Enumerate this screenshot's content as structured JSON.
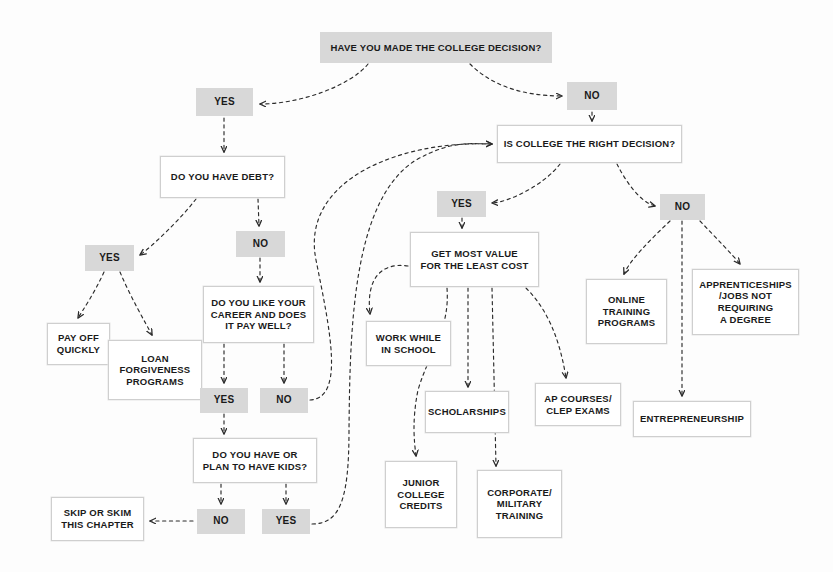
{
  "diagram": {
    "background_color": "#fdfdfd",
    "filled_node_color": "#d8d8d8",
    "outlined_node_border_color": "#cfcfcf",
    "text_color": "#1a1a1a"
  },
  "nodes": [
    {
      "id": "q_college_decision",
      "label": "HAVE YOU MADE THE COLLEGE DECISION?",
      "style": "filled",
      "x": 320,
      "y": 32,
      "w": 232,
      "h": 31,
      "font": 9.5
    },
    {
      "id": "yes_1",
      "label": "YES",
      "style": "filled",
      "x": 196,
      "y": 88,
      "w": 57,
      "h": 28,
      "font": 10
    },
    {
      "id": "no_1",
      "label": "NO",
      "style": "filled",
      "x": 567,
      "y": 82,
      "w": 50,
      "h": 28,
      "font": 10
    },
    {
      "id": "q_have_debt",
      "label": "DO YOU HAVE DEBT?",
      "style": "outlined",
      "x": 160,
      "y": 156,
      "w": 125,
      "h": 42,
      "font": 9.5
    },
    {
      "id": "q_college_right",
      "label": "IS COLLEGE THE RIGHT DECISION?",
      "style": "outlined",
      "x": 497,
      "y": 125,
      "w": 185,
      "h": 38,
      "font": 9.5
    },
    {
      "id": "yes_2",
      "label": "YES",
      "style": "filled",
      "x": 85,
      "y": 245,
      "w": 49,
      "h": 26,
      "font": 10
    },
    {
      "id": "no_2",
      "label": "NO",
      "style": "filled",
      "x": 236,
      "y": 231,
      "w": 49,
      "h": 26,
      "font": 10
    },
    {
      "id": "yes_3",
      "label": "YES",
      "style": "filled",
      "x": 437,
      "y": 191,
      "w": 49,
      "h": 26,
      "font": 10
    },
    {
      "id": "no_3",
      "label": "NO",
      "style": "filled",
      "x": 660,
      "y": 194,
      "w": 45,
      "h": 26,
      "font": 10
    },
    {
      "id": "pay_off_quickly",
      "label": "PAY OFF\nQUICKLY",
      "style": "outlined",
      "x": 47,
      "y": 323,
      "w": 63,
      "h": 42,
      "font": 9.5
    },
    {
      "id": "loan_forgiveness",
      "label": "LOAN\nFORGIVENESS\nPROGRAMS",
      "style": "outlined",
      "x": 108,
      "y": 340,
      "w": 94,
      "h": 60,
      "font": 9.5
    },
    {
      "id": "q_like_career",
      "label": "DO YOU LIKE YOUR\nCAREER AND DOES\nIT PAY WELL?",
      "style": "outlined",
      "x": 203,
      "y": 286,
      "w": 111,
      "h": 57,
      "font": 9.5
    },
    {
      "id": "get_most_value",
      "label": "GET MOST VALUE\nFOR THE LEAST COST",
      "style": "outlined",
      "x": 410,
      "y": 232,
      "w": 129,
      "h": 55,
      "font": 9.5
    },
    {
      "id": "online_training",
      "label": "ONLINE\nTRAINING\nPROGRAMS",
      "style": "outlined",
      "x": 586,
      "y": 279,
      "w": 81,
      "h": 65,
      "font": 9.5
    },
    {
      "id": "apprenticeships",
      "label": "APPRENTICESHIPS\n/JOBS NOT\nREQUIRING\nA DEGREE",
      "style": "outlined",
      "x": 692,
      "y": 269,
      "w": 107,
      "h": 66,
      "font": 9.5
    },
    {
      "id": "work_while_school",
      "label": "WORK WHILE\nIN SCHOOL",
      "style": "outlined",
      "x": 366,
      "y": 321,
      "w": 85,
      "h": 45,
      "font": 9.5
    },
    {
      "id": "yes_4",
      "label": "YES",
      "style": "filled",
      "x": 200,
      "y": 388,
      "w": 48,
      "h": 25,
      "font": 10
    },
    {
      "id": "no_4",
      "label": "NO",
      "style": "filled",
      "x": 260,
      "y": 388,
      "w": 48,
      "h": 25,
      "font": 10
    },
    {
      "id": "scholarships",
      "label": "SCHOLARSHIPS",
      "style": "outlined",
      "x": 425,
      "y": 391,
      "w": 84,
      "h": 42,
      "font": 9.5
    },
    {
      "id": "ap_courses",
      "label": "AP COURSES/\nCLEP EXAMS",
      "style": "outlined",
      "x": 535,
      "y": 383,
      "w": 86,
      "h": 43,
      "font": 9.5
    },
    {
      "id": "entrepreneurship",
      "label": "ENTREPRENEURSHIP",
      "style": "outlined",
      "x": 633,
      "y": 401,
      "w": 118,
      "h": 36,
      "font": 9.5
    },
    {
      "id": "q_have_kids",
      "label": "DO YOU HAVE OR\nPLAN TO HAVE KIDS?",
      "style": "outlined",
      "x": 193,
      "y": 438,
      "w": 124,
      "h": 45,
      "font": 9.5
    },
    {
      "id": "junior_college",
      "label": "JUNIOR\nCOLLEGE\nCREDITS",
      "style": "outlined",
      "x": 385,
      "y": 461,
      "w": 72,
      "h": 67,
      "font": 9.5
    },
    {
      "id": "corporate_military",
      "label": "CORPORATE/\nMILITARY\nTRAINING",
      "style": "outlined",
      "x": 477,
      "y": 470,
      "w": 85,
      "h": 68,
      "font": 9.5
    },
    {
      "id": "no_5",
      "label": "NO",
      "style": "filled",
      "x": 197,
      "y": 509,
      "w": 48,
      "h": 25,
      "font": 10
    },
    {
      "id": "yes_5",
      "label": "YES",
      "style": "filled",
      "x": 262,
      "y": 509,
      "w": 48,
      "h": 25,
      "font": 10
    },
    {
      "id": "skip_or_skim",
      "label": "SKIP OR SKIM\nTHIS CHAPTER",
      "style": "outlined",
      "x": 51,
      "y": 497,
      "w": 93,
      "h": 44,
      "font": 9.5
    }
  ],
  "edges": [
    {
      "from": "q_college_decision",
      "to": "yes_1",
      "d": "M 368 64 C 350 86, 300 104, 260 104"
    },
    {
      "from": "q_college_decision",
      "to": "no_1",
      "d": "M 470 64 C 490 84, 520 96, 562 96"
    },
    {
      "from": "yes_1",
      "to": "q_have_debt",
      "d": "M 224 118 L 224 152"
    },
    {
      "from": "no_1",
      "to": "q_college_right",
      "d": "M 592 112 L 592 121"
    },
    {
      "from": "q_have_debt",
      "to": "yes_2",
      "d": "M 196 199 C 180 220, 150 248, 140 255"
    },
    {
      "from": "q_have_debt",
      "to": "no_2",
      "d": "M 258 199 L 259 226"
    },
    {
      "from": "q_college_right",
      "to": "yes_3",
      "d": "M 560 164 C 545 184, 510 202, 492 203"
    },
    {
      "from": "q_college_right",
      "to": "no_3",
      "d": "M 617 164 C 626 182, 640 202, 655 206"
    },
    {
      "from": "yes_2",
      "to": "pay_off_quickly",
      "d": "M 104 272 C 95 292, 83 310, 78 318"
    },
    {
      "from": "yes_2",
      "to": "loan_forgiveness",
      "d": "M 120 272 C 130 296, 145 322, 152 335"
    },
    {
      "from": "no_2",
      "to": "q_like_career",
      "d": "M 260 258 L 260 282"
    },
    {
      "from": "q_like_career",
      "to": "yes_4",
      "d": "M 224 344 L 224 383"
    },
    {
      "from": "q_like_career",
      "to": "no_4",
      "d": "M 284 344 L 284 383"
    },
    {
      "from": "yes_4",
      "to": "q_have_kids",
      "d": "M 224 414 L 224 434"
    },
    {
      "from": "q_have_kids",
      "to": "no_5",
      "d": "M 221 484 L 221 504"
    },
    {
      "from": "q_have_kids",
      "to": "yes_5",
      "d": "M 286 484 L 286 504"
    },
    {
      "from": "no_5",
      "to": "skip_or_skim",
      "d": "M 193 521 L 150 521"
    },
    {
      "from": "no_4",
      "to": "q_college_right",
      "d": "M 310 400 C 345 398, 330 330, 316 260 C 300 180, 400 140, 492 144"
    },
    {
      "from": "yes_5",
      "to": "q_college_right",
      "d": "M 312 524 C 340 524, 349 500, 349 430 C 350 330, 352 200, 416 160 C 452 140, 470 144, 492 144"
    },
    {
      "from": "yes_3",
      "to": "get_most_value",
      "d": "M 462 218 L 462 228"
    },
    {
      "from": "get_most_value",
      "to": "work_while_school",
      "d": "M 408 266 C 380 262, 366 280, 370 314"
    },
    {
      "from": "get_most_value",
      "to": "scholarships",
      "d": "M 468 288 L 468 387"
    },
    {
      "from": "get_most_value",
      "to": "corporate_military",
      "d": "M 492 288 L 496 466"
    },
    {
      "from": "get_most_value",
      "to": "junior_college",
      "d": "M 447 288 C 450 330, 430 350, 418 390 C 412 420, 414 440, 416 456"
    },
    {
      "from": "get_most_value",
      "to": "ap_courses",
      "d": "M 526 288 C 548 310, 560 340, 566 378"
    },
    {
      "from": "no_3",
      "to": "online_training",
      "d": "M 670 221 C 650 240, 630 260, 624 274"
    },
    {
      "from": "no_3",
      "to": "apprenticeships",
      "d": "M 700 221 C 716 238, 732 254, 740 264"
    },
    {
      "from": "no_3",
      "to": "entrepreneurship",
      "d": "M 682 221 L 682 396"
    }
  ]
}
